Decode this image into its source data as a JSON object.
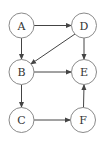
{
  "diagram": {
    "type": "directed-graph",
    "nodes": [
      {
        "id": "A",
        "label": "A",
        "cx": 21.5,
        "cy": 25.5
      },
      {
        "id": "D",
        "label": "D",
        "cx": 84,
        "cy": 25.5
      },
      {
        "id": "B",
        "label": "B",
        "cx": 21.5,
        "cy": 72
      },
      {
        "id": "E",
        "label": "E",
        "cx": 84,
        "cy": 72
      },
      {
        "id": "C",
        "label": "C",
        "cx": 21.5,
        "cy": 120
      },
      {
        "id": "F",
        "label": "F",
        "cx": 83,
        "cy": 120
      }
    ],
    "edges": [
      {
        "from": "A",
        "to": "D"
      },
      {
        "from": "A",
        "to": "B"
      },
      {
        "from": "D",
        "to": "B"
      },
      {
        "from": "D",
        "to": "E"
      },
      {
        "from": "B",
        "to": "E"
      },
      {
        "from": "B",
        "to": "C"
      },
      {
        "from": "C",
        "to": "F"
      },
      {
        "from": "F",
        "to": "E"
      }
    ],
    "node_radius": 12.5,
    "colors": {
      "node_stroke": "#8a8a8a",
      "edge": "#444444",
      "text": "#333333",
      "background": "#ffffff"
    }
  }
}
